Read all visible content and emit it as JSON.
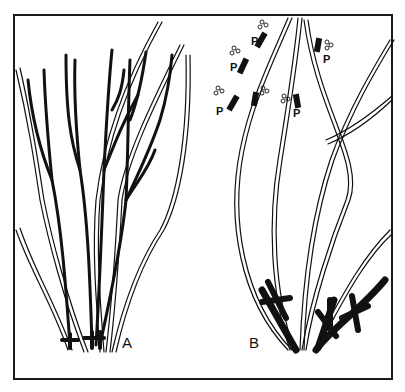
{
  "figure": {
    "colors": {
      "ink": "#111111",
      "paper": "#ffffff"
    }
  },
  "panels": [
    {
      "id": "A",
      "label": "A"
    },
    {
      "id": "B",
      "label": "B"
    }
  ],
  "pruning_marks": {
    "label": "P",
    "count": 6
  }
}
